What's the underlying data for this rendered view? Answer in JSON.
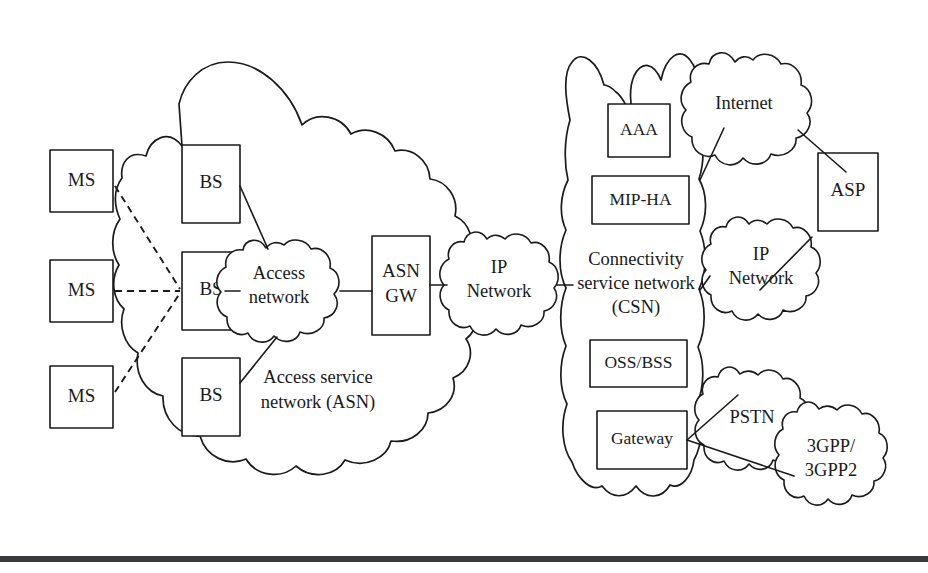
{
  "diagram": {
    "background_color": "#ffffff",
    "stroke_color": "#1a1a1a",
    "rule_color": "#3a3a3c"
  },
  "subscriber_stations": [
    {
      "label": "MS"
    },
    {
      "label": "MS"
    },
    {
      "label": "MS"
    }
  ],
  "base_stations": [
    {
      "label": "BS"
    },
    {
      "label": "BS"
    },
    {
      "label": "BS"
    }
  ],
  "asn": {
    "region_label_line1": "Access service",
    "region_label_line2": "network (ASN)",
    "access_network": {
      "line1": "Access",
      "line2": "network"
    },
    "gateway": {
      "line1": "ASN",
      "line2": "GW"
    }
  },
  "core_ip_network": {
    "line1": "IP",
    "line2": "Network"
  },
  "csn": {
    "region_label_line1": "Connectivity",
    "region_label_line2": "service network",
    "region_label_line3": "(CSN)",
    "nodes": [
      {
        "label": "AAA"
      },
      {
        "label": "MIP-HA"
      },
      {
        "label": "OSS/BSS"
      },
      {
        "label": "Gateway"
      }
    ]
  },
  "external": {
    "internet": {
      "label": "Internet"
    },
    "ip_network": {
      "line1": "IP",
      "line2": "Network"
    },
    "asp": {
      "label": "ASP"
    },
    "pstn": {
      "label": "PSTN"
    },
    "legacy_mobile": {
      "line1": "3GPP/",
      "line2": "3GPP2"
    }
  }
}
